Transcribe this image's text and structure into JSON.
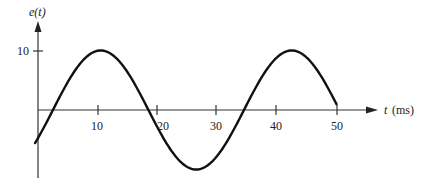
{
  "chart_data": {
    "type": "line",
    "title": "",
    "xlabel": "t (ms)",
    "ylabel": "e(t)",
    "x_ticks": [
      10,
      20,
      30,
      40,
      50
    ],
    "y_ticks": [
      10
    ],
    "xlim": [
      0,
      55
    ],
    "ylim": [
      -10,
      12
    ],
    "grid": false,
    "series": [
      {
        "name": "e(t)",
        "function": "10*sin(2*pi*(t-2.5)/32)",
        "x": [
          -0.5,
          2.5,
          10.5,
          18.5,
          26.5,
          34.5,
          42.5,
          50.5
        ],
        "values": [
          -2.9,
          0,
          10,
          0,
          -10,
          0,
          10,
          0
        ]
      }
    ]
  },
  "labels": {
    "y_axis": "e(t)",
    "x_axis_var": "t",
    "x_axis_unit": "(ms)",
    "y_tick_10": "10",
    "x_ticks": [
      "10",
      "20",
      "30",
      "40",
      "50"
    ]
  },
  "colors": {
    "line": "#111111",
    "axis": "#333333"
  }
}
